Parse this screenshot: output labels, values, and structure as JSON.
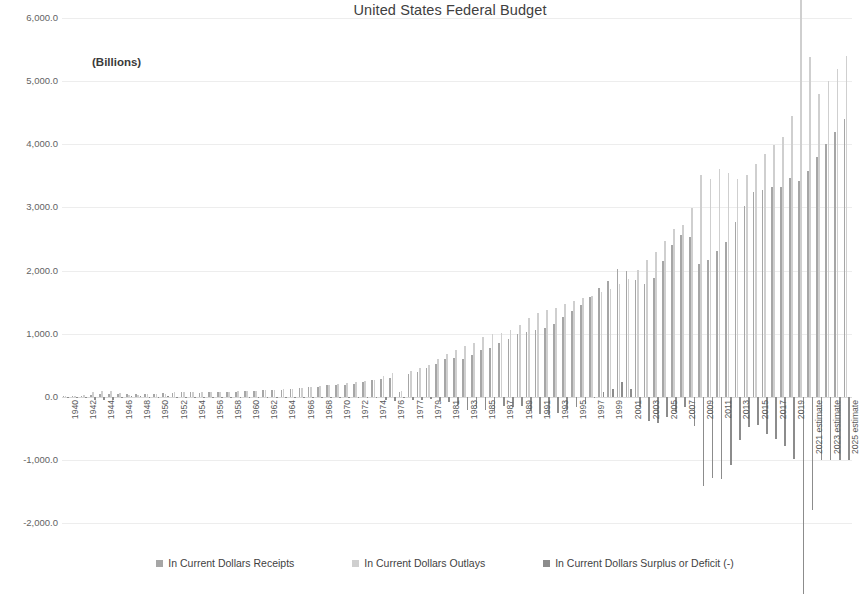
{
  "chart_data": {
    "type": "bar",
    "title": "United States Federal Budget",
    "units_label": "(Billions)",
    "xlabel": "",
    "ylabel": "",
    "ylim": [
      -2000,
      6000
    ],
    "ytick_step": 1000,
    "grid": true,
    "legend_position": "bottom",
    "ytick_labels": [
      "6,000.0",
      "5,000.0",
      "4,000.0",
      "3,000.0",
      "2,000.0",
      "1,000.0",
      "0.0",
      "-1,000.0",
      "-2,000.0"
    ],
    "ytick_values": [
      6000,
      5000,
      4000,
      3000,
      2000,
      1000,
      0,
      -1000,
      -2000
    ],
    "categories": [
      "1940",
      "1941",
      "1942",
      "1943",
      "1944",
      "1945",
      "1946",
      "1947",
      "1948",
      "1949",
      "1950",
      "1951",
      "1952",
      "1953",
      "1954",
      "1955",
      "1956",
      "1957",
      "1958",
      "1959",
      "1960",
      "1961",
      "1962",
      "1963",
      "1964",
      "1965",
      "1966",
      "1967",
      "1968",
      "1969",
      "1970",
      "1971",
      "1972",
      "1973",
      "1974",
      "1975",
      "1976",
      "TQ",
      "1977",
      "1978",
      "1979",
      "1980",
      "1981",
      "1982",
      "1983",
      "1984",
      "1985",
      "1986",
      "1987",
      "1988",
      "1989",
      "1990",
      "1991",
      "1992",
      "1993",
      "1994",
      "1995",
      "1996",
      "1997",
      "1998",
      "1999",
      "2000",
      "2001",
      "2002",
      "2003",
      "2004",
      "2005",
      "2006",
      "2007",
      "2008",
      "2009",
      "2010",
      "2011",
      "2012",
      "2013",
      "2014",
      "2015",
      "2016",
      "2017",
      "2018",
      "2019",
      "2020",
      "2021 estimate",
      "2022 estimate",
      "2023 estimate",
      "2024 estimate",
      "2025 estimate"
    ],
    "xtick_labels": [
      "1940",
      "1942",
      "1944",
      "1946",
      "1948",
      "1950",
      "1952",
      "1954",
      "1956",
      "1958",
      "1960",
      "1962",
      "1964",
      "1966",
      "1968",
      "1970",
      "1972",
      "1974",
      "1976",
      "1977",
      "1979",
      "1981",
      "1983",
      "1985",
      "1987",
      "1989",
      "1991",
      "1993",
      "1995",
      "1997",
      "1999",
      "2001",
      "2003",
      "2005",
      "2007",
      "2009",
      "2011",
      "2013",
      "2015",
      "2017",
      "2019",
      "2021 estimate",
      "2023 estimate",
      "2025 estimate"
    ],
    "series": [
      {
        "name": "In Current Dollars Receipts",
        "color": "#a6a6a6",
        "values": [
          6.5,
          8.7,
          14.6,
          24.0,
          43.7,
          45.2,
          39.3,
          38.5,
          41.6,
          39.4,
          39.4,
          51.6,
          66.2,
          69.6,
          69.7,
          65.5,
          74.6,
          80.0,
          79.6,
          79.2,
          92.5,
          94.4,
          99.7,
          106.6,
          112.6,
          116.8,
          130.8,
          148.8,
          153.0,
          186.9,
          192.8,
          187.1,
          207.3,
          230.8,
          263.2,
          279.1,
          298.1,
          81.2,
          355.6,
          399.6,
          463.3,
          517.1,
          599.3,
          617.8,
          600.6,
          666.4,
          734.0,
          769.2,
          854.3,
          909.2,
          991.1,
          1032.0,
          1055.0,
          1091.2,
          1154.3,
          1258.6,
          1351.8,
          1453.1,
          1579.2,
          1721.7,
          1827.5,
          2025.2,
          1991.1,
          1853.1,
          1782.3,
          1880.1,
          2153.6,
          2406.9,
          2568.0,
          2524.0,
          2105.0,
          2162.7,
          2303.5,
          2450.0,
          2775.1,
          3021.5,
          3249.9,
          3268.0,
          3316.2,
          3329.9,
          3463.4,
          3421.2,
          3581.0,
          3796.0,
          4000.0,
          4200.0,
          4400.0
        ]
      },
      {
        "name": "In Current Dollars Outlays",
        "color": "#cfcfcf",
        "values": [
          9.5,
          13.7,
          35.1,
          78.6,
          91.3,
          92.7,
          55.2,
          34.5,
          29.8,
          38.8,
          42.6,
          45.5,
          67.7,
          76.1,
          70.9,
          68.4,
          70.6,
          76.6,
          82.4,
          92.1,
          92.2,
          97.7,
          106.8,
          111.3,
          118.5,
          118.2,
          134.5,
          157.5,
          178.1,
          183.6,
          195.6,
          210.2,
          230.7,
          245.7,
          269.4,
          332.3,
          371.8,
          96.0,
          409.2,
          458.7,
          504.0,
          590.9,
          678.2,
          745.7,
          808.4,
          851.8,
          946.3,
          990.4,
          1004.0,
          1064.4,
          1143.7,
          1253.0,
          1324.2,
          1381.5,
          1409.4,
          1461.8,
          1515.7,
          1560.5,
          1601.1,
          1652.5,
          1701.8,
          1789.0,
          1862.8,
          2010.9,
          2159.9,
          2292.8,
          2472.0,
          2655.0,
          2728.7,
          2982.5,
          3517.7,
          3457.1,
          3603.1,
          3537.0,
          3454.6,
          3506.1,
          3691.8,
          3852.6,
          3981.6,
          4109.0,
          4447.0,
          6552.0,
          5380.0,
          4800.0,
          5000.0,
          5200.0,
          5400.0
        ]
      },
      {
        "name": "In Current Dollars Surplus or Deficit (-)",
        "color": "#8c8c8c",
        "values": [
          -2.9,
          -4.9,
          -20.5,
          -54.6,
          -47.6,
          -47.6,
          -15.9,
          4.0,
          11.8,
          0.6,
          -3.1,
          6.1,
          -1.5,
          -6.5,
          -1.2,
          -3.0,
          3.9,
          3.4,
          -2.8,
          -12.8,
          0.3,
          -3.3,
          -7.1,
          -4.8,
          -5.9,
          -1.4,
          -3.7,
          -8.6,
          -25.2,
          3.2,
          -2.8,
          -23.0,
          -23.4,
          -14.9,
          -6.1,
          -53.2,
          -73.7,
          -14.7,
          -53.7,
          -59.2,
          -40.7,
          -73.8,
          -79.0,
          -128.0,
          -207.8,
          -185.4,
          -212.3,
          -221.2,
          -149.7,
          -155.2,
          -152.6,
          -221.0,
          -269.2,
          -290.3,
          -255.1,
          -203.2,
          -164.0,
          -107.4,
          -21.9,
          69.3,
          125.6,
          236.2,
          128.2,
          -157.8,
          -377.6,
          -412.7,
          -318.3,
          -248.2,
          -160.7,
          -458.6,
          -1412.7,
          -1294.4,
          -1299.6,
          -1087.0,
          -679.5,
          -484.6,
          -441.9,
          -584.7,
          -665.4,
          -779.1,
          -984.4,
          -3131.9,
          -1799.0,
          -1004.0,
          -1000.0,
          -1000.0,
          -1000.0
        ]
      }
    ]
  },
  "legend": [
    {
      "label": "In Current Dollars Receipts",
      "color": "#a6a6a6"
    },
    {
      "label": "In Current Dollars Outlays",
      "color": "#cfcfcf"
    },
    {
      "label": "In Current Dollars Surplus or Deficit (-)",
      "color": "#8c8c8c"
    }
  ]
}
